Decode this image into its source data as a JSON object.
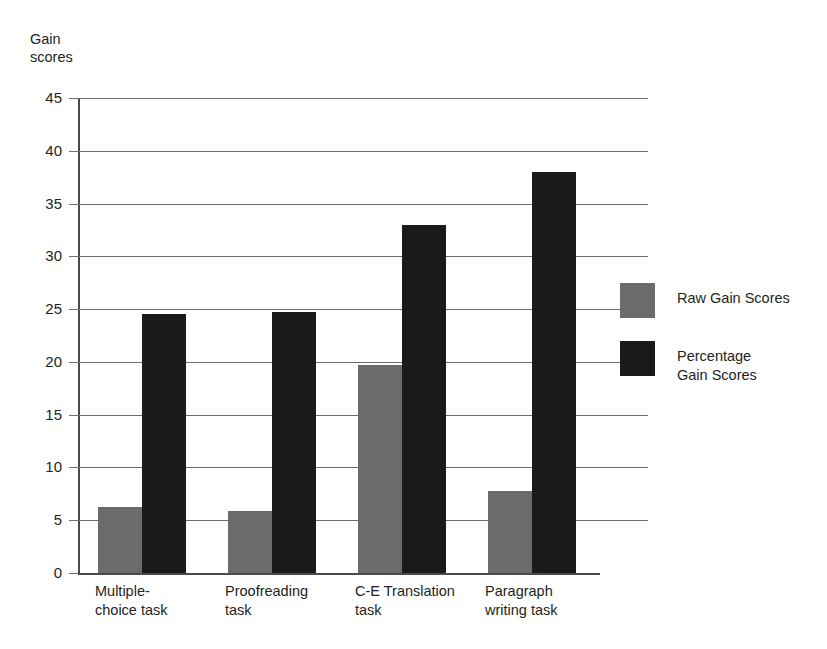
{
  "chart_data": {
    "type": "bar",
    "title": "",
    "xlabel": "",
    "ylabel": "Gain\nscores",
    "ylim": [
      0,
      45
    ],
    "ytick_step": 5,
    "yticks": [
      "45",
      "40",
      "35",
      "30",
      "25",
      "20",
      "15",
      "10",
      "5",
      "0"
    ],
    "grid": true,
    "legend_position": "right",
    "categories": [
      "Multiple-\nchoice task",
      "Proofreading\ntask",
      "C-E Translation\ntask",
      "Paragraph\nwriting task"
    ],
    "series": [
      {
        "name": "Raw Gain Scores",
        "color": "#6b6b6b",
        "values": [
          6.3,
          5.9,
          19.7,
          7.8
        ]
      },
      {
        "name": "Percentage\nGain Scores",
        "color": "#1a1a1a",
        "values": [
          24.5,
          24.7,
          33.0,
          38.0
        ]
      }
    ]
  },
  "legend": {
    "items": [
      {
        "label": "Raw Gain Scores",
        "color": "#6b6b6b"
      },
      {
        "label": "Percentage\nGain Scores",
        "color": "#1a1a1a"
      }
    ]
  },
  "axis": {
    "y_title": "Gain\nscores"
  },
  "colors": {
    "raw_gain": "#6b6b6b",
    "percentage_gain": "#1a1a1a",
    "axis": "#4a4a4a",
    "gridline": "#6e6e6e",
    "text": "#231f20",
    "background": "#ffffff"
  }
}
